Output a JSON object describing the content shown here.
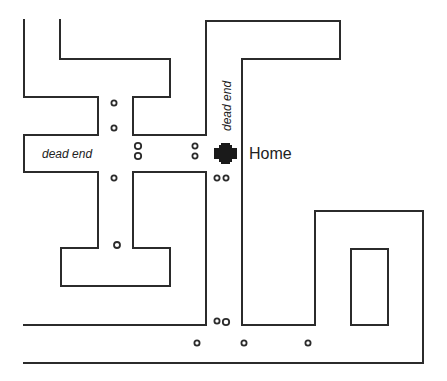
{
  "map": {
    "width": 447,
    "height": 381,
    "line_color": "#2b2b2b",
    "background": "#ffffff",
    "streets": [
      {
        "id": "top-left-outer",
        "points": "24,20 24,97 98,97 98,135 24,135 24,172 98,172 98,248 61,248 61,286 170,286 170,248 133,248 133,172 206,172 206,325 24,325"
      },
      {
        "id": "top-left-inner",
        "points": "60,20 60,59 170,59 170,97 133,97 133,135 206,135 206,21 340,21 340,59 242,59 242,325 315,325 315,211 423,211 423,363 24,363"
      },
      {
        "id": "inner-block",
        "points": "351,249 388,249 388,325 351,325 351,249"
      }
    ],
    "markers": [
      {
        "cx": 114,
        "cy": 103,
        "r": 2.6
      },
      {
        "cx": 114,
        "cy": 128,
        "r": 2.6
      },
      {
        "cx": 138,
        "cy": 146,
        "r": 3.2
      },
      {
        "cx": 138,
        "cy": 156,
        "r": 3.2
      },
      {
        "cx": 195,
        "cy": 146,
        "r": 2.6
      },
      {
        "cx": 195,
        "cy": 156,
        "r": 2.6
      },
      {
        "cx": 114,
        "cy": 178,
        "r": 2.6
      },
      {
        "cx": 117,
        "cy": 245,
        "r": 3.0
      },
      {
        "cx": 217,
        "cy": 178,
        "r": 2.6
      },
      {
        "cx": 226,
        "cy": 178,
        "r": 2.6
      },
      {
        "cx": 217,
        "cy": 321,
        "r": 2.6
      },
      {
        "cx": 226,
        "cy": 322,
        "r": 3.2
      },
      {
        "cx": 197,
        "cy": 343,
        "r": 2.6
      },
      {
        "cx": 244,
        "cy": 343,
        "r": 2.6
      },
      {
        "cx": 308,
        "cy": 343,
        "r": 2.6
      }
    ],
    "labels": {
      "dead_end_left": "dead end",
      "dead_end_vertical": "dead end",
      "home": "Home"
    },
    "home_icon": "cross-icon"
  }
}
